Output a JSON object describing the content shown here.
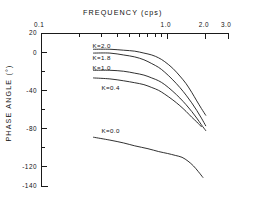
{
  "chart_data": {
    "type": "line",
    "title": "FREQUENCY (cps)",
    "xlabel": "FREQUENCY (cps)",
    "ylabel": "PHASE ANGLE (°)",
    "xscale": "log",
    "xlim": [
      0.1,
      3.0
    ],
    "ylim": [
      -140,
      20
    ],
    "grid": false,
    "legend_position": "inline-curve-labels",
    "x_axis_position": "top",
    "xticks_major": [
      0.1,
      1.0,
      2.0,
      3.0
    ],
    "xtick_labels": [
      "0.1",
      "1.0",
      "2.0",
      "3.0"
    ],
    "xticks_minor": [
      0.2,
      0.3,
      0.4,
      0.5,
      0.6,
      0.7,
      0.8,
      0.9
    ],
    "yticks_major": [
      20,
      0,
      -40,
      -80,
      -120,
      -140
    ],
    "ytick_labels": [
      "20",
      "0",
      "-40",
      "-80",
      "-120",
      "-140"
    ],
    "yticks_minor": [
      -20,
      -60,
      -100
    ],
    "series": [
      {
        "name": "K=2.0",
        "label": "K=2.0",
        "label_x": 0.255,
        "label_y": 6,
        "x": [
          0.26,
          0.35,
          0.45,
          0.55,
          0.65,
          0.75,
          0.85,
          0.95,
          1.1,
          1.25,
          1.4,
          1.55,
          1.7,
          1.85,
          2.0
        ],
        "y": [
          3,
          3,
          2,
          1,
          -1,
          -3,
          -6,
          -10,
          -17,
          -25,
          -33,
          -42,
          -51,
          -59,
          -66
        ]
      },
      {
        "name": "K=1.8",
        "label": "K=1.8",
        "label_x": 0.255,
        "label_y": -6,
        "x": [
          0.26,
          0.35,
          0.45,
          0.55,
          0.65,
          0.75,
          0.85,
          0.95,
          1.1,
          1.25,
          1.4,
          1.55,
          1.7,
          1.85,
          2.0
        ],
        "y": [
          -1,
          -1,
          -3,
          -5,
          -8,
          -12,
          -16,
          -21,
          -29,
          -37,
          -45,
          -53,
          -61,
          -69,
          -77
        ]
      },
      {
        "name": "K=1.0",
        "label": "K=1.0",
        "label_x": 0.255,
        "label_y": -17,
        "x": [
          0.26,
          0.35,
          0.45,
          0.55,
          0.65,
          0.75,
          0.85,
          0.95,
          1.1,
          1.25,
          1.4,
          1.55,
          1.7,
          1.85,
          2.0
        ],
        "y": [
          -19,
          -19,
          -20,
          -22,
          -24,
          -27,
          -30,
          -34,
          -41,
          -48,
          -55,
          -62,
          -69,
          -76,
          -82
        ]
      },
      {
        "name": "K=0.4",
        "label": "K=0.4",
        "label_x": 0.3,
        "label_y": -38,
        "x": [
          0.26,
          0.35,
          0.45,
          0.55,
          0.65,
          0.75,
          0.85,
          0.95,
          1.1,
          1.25,
          1.4,
          1.55,
          1.7,
          1.85
        ],
        "y": [
          -27,
          -28,
          -30,
          -32,
          -34,
          -37,
          -40,
          -44,
          -50,
          -56,
          -62,
          -68,
          -73,
          -78
        ]
      },
      {
        "name": "K=0.0",
        "label": "K=0.0",
        "label_x": 0.3,
        "label_y": -83,
        "x": [
          0.26,
          0.35,
          0.45,
          0.55,
          0.7,
          0.85,
          1.0,
          1.15,
          1.3,
          1.45,
          1.6,
          1.75,
          1.9
        ],
        "y": [
          -89,
          -92,
          -95,
          -98,
          -101,
          -104,
          -106,
          -108,
          -110,
          -114,
          -119,
          -125,
          -131
        ]
      }
    ]
  },
  "axes": {
    "top_axis_title": "FREQUENCY (cps)",
    "left_axis_title": "PHASE ANGLE (°)"
  }
}
